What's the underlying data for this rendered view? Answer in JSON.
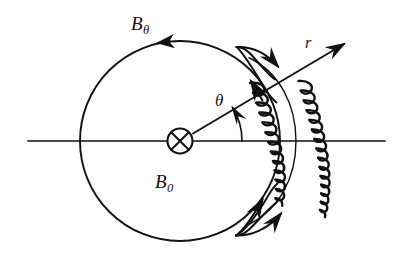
{
  "figure": {
    "background_color": "#ffffff",
    "ink_color": "#111111"
  },
  "labels": {
    "poloidal_field": {
      "base": "B",
      "subscript": "θ",
      "full": "Bθ",
      "meaning": "poloidal-magnetic-field"
    },
    "axial_field": {
      "base": "B",
      "subscript": "0",
      "full": "B0",
      "meaning": "axial-magnetic-field-into-page"
    },
    "angle": {
      "base": "θ",
      "full": "θ",
      "meaning": "poloidal-angle"
    },
    "radius": {
      "base": "r",
      "full": "r",
      "meaning": "radial-coordinate"
    }
  },
  "geometry": {
    "circle": {
      "cx": 180,
      "cy": 141,
      "r": 100
    },
    "center_symbol": "⊗",
    "center_symbol_radius": 13,
    "horizontal_axis": {
      "x1": 28,
      "y1": 141,
      "x2": 385,
      "y2": 141
    },
    "radial_arrow": {
      "x1": 180,
      "y1": 141,
      "x2": 347,
      "y2": 42,
      "angle_deg": 31
    },
    "angle_arc": {
      "start_deg": 0,
      "end_deg": 31,
      "radius": 62
    },
    "inner_coil": {
      "cx": 180,
      "cy": 141,
      "r": 84,
      "span_deg": 86,
      "turns": 13
    },
    "outer_coil": {
      "cx": 180,
      "cy": 141,
      "r": 128,
      "span_deg": 64,
      "turns": 17
    },
    "guide_arc": {
      "cx": 180,
      "cy": 141,
      "r": 106,
      "span_deg": 78
    }
  },
  "annotations": {
    "poloidal_direction": "counterclockwise",
    "axial_direction": "into-page",
    "loop_arrow_count": 4
  }
}
